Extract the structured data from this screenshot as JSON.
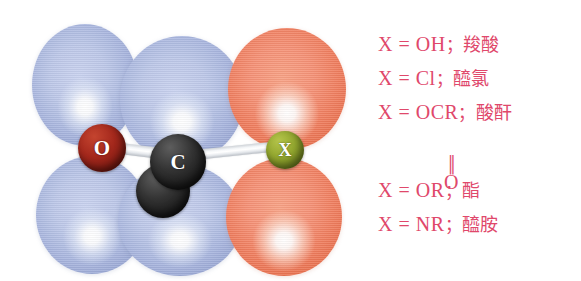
{
  "figure": {
    "background_color": "#ffffff"
  },
  "orbital_diagram": {
    "name": "carbonyl-p-orbital-overlap",
    "lobe_color_blue": "#aab7df",
    "lobe_color_orange": "#f07f60",
    "bond_color": "#eef0f3",
    "atoms": [
      {
        "id": "oxygen",
        "label": "O",
        "color": "#a4281c"
      },
      {
        "id": "carbon",
        "label": "C",
        "color": "#1b1b1b"
      },
      {
        "id": "substituent",
        "label": "X",
        "color": "#93a72f"
      }
    ],
    "lobes": [
      {
        "id": "o-top",
        "phase": "blue"
      },
      {
        "id": "c-top",
        "phase": "blue"
      },
      {
        "id": "x-top",
        "phase": "orange"
      },
      {
        "id": "o-bottom",
        "phase": "blue"
      },
      {
        "id": "c-bottom",
        "phase": "blue"
      },
      {
        "id": "x-bottom",
        "phase": "orange"
      }
    ]
  },
  "legend": {
    "text_color": "#e0486b",
    "lines": [
      {
        "id": "carboxylic-acid",
        "lhs": "X = OH",
        "sep": "；",
        "name": "羧酸"
      },
      {
        "id": "acyl-chloride",
        "lhs": "X = Cl",
        "sep": "；",
        "name": "醯氯"
      },
      {
        "id": "acid-anhydride",
        "lhs": "X = OCR",
        "sep": "；",
        "name": "酸酐"
      },
      {
        "id": "ester",
        "lhs": "X = OR",
        "sep": "；",
        "name": "酯"
      },
      {
        "id": "amide",
        "lhs": "X = NR",
        "sep": "；",
        "name": "醯胺"
      }
    ],
    "anhydride_double_bond": "‖",
    "anhydride_oxygen": "O"
  }
}
